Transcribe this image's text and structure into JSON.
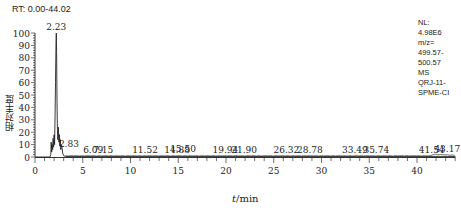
{
  "chart_data": {
    "type": "line",
    "title": "RT: 0.00-44.02",
    "xlabel": "t/min",
    "ylabel": "相对丰度",
    "xlim": [
      0,
      44.02
    ],
    "ylim": [
      0,
      100
    ],
    "x_ticks": [
      0,
      5,
      10,
      15,
      20,
      25,
      30,
      35,
      40
    ],
    "y_ticks": [
      0,
      10,
      20,
      30,
      40,
      50,
      60,
      70,
      80,
      90,
      100
    ],
    "grid": false,
    "peak_labels": [
      {
        "rt": 2.23,
        "label": "2.23",
        "intensity": 100
      },
      {
        "rt": 2.83,
        "label": "2.83",
        "intensity": 10
      },
      {
        "rt": 6.09,
        "label": "6.09",
        "intensity": 1
      },
      {
        "rt": 7.15,
        "label": "7.15",
        "intensity": 1
      },
      {
        "rt": 11.52,
        "label": "11.52",
        "intensity": 1
      },
      {
        "rt": 14.88,
        "label": "14.88",
        "intensity": 1
      },
      {
        "rt": 15.5,
        "label": "15.50",
        "intensity": 1.5
      },
      {
        "rt": 19.94,
        "label": "19.94",
        "intensity": 1
      },
      {
        "rt": 21.9,
        "label": "21.90",
        "intensity": 1
      },
      {
        "rt": 26.32,
        "label": "26.32",
        "intensity": 1
      },
      {
        "rt": 28.78,
        "label": "28.78",
        "intensity": 1
      },
      {
        "rt": 33.49,
        "label": "33.49",
        "intensity": 1
      },
      {
        "rt": 35.74,
        "label": "35.74",
        "intensity": 1
      },
      {
        "rt": 41.54,
        "label": "41.54",
        "intensity": 1
      },
      {
        "rt": 43.17,
        "label": "43.17",
        "intensity": 2
      }
    ],
    "trace": {
      "x": [
        0,
        1.55,
        1.65,
        1.7,
        1.75,
        1.8,
        1.85,
        1.9,
        1.95,
        2.0,
        2.05,
        2.1,
        2.15,
        2.2,
        2.23,
        2.26,
        2.3,
        2.35,
        2.4,
        2.45,
        2.5,
        2.55,
        2.6,
        2.65,
        2.7,
        2.75,
        2.83,
        2.9,
        3.0,
        3.2,
        44.02
      ],
      "y": [
        0,
        0,
        2,
        12,
        4,
        10,
        6,
        15,
        8,
        18,
        10,
        35,
        60,
        92,
        100,
        85,
        45,
        22,
        14,
        24,
        12,
        18,
        9,
        14,
        6,
        10,
        8,
        3,
        1,
        0.5,
        0.5
      ]
    }
  },
  "annotations": {
    "rt_range": "RT: 0.00-44.02",
    "info": [
      "NL:",
      "4.98E6",
      "m/z=",
      "499.57-",
      "500.57",
      "MS",
      "QRJ-11-",
      "SPME-CI"
    ]
  },
  "axes": {
    "ylabel": "相对丰度",
    "xlabel_var": "t",
    "xlabel_unit": "/min"
  },
  "colors": {
    "line": "#222222",
    "axis": "#333333",
    "text": "#222222"
  }
}
